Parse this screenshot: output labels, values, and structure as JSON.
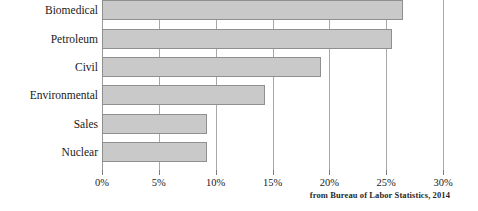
{
  "chart_data": {
    "type": "bar",
    "orientation": "horizontal",
    "title": "",
    "xlabel": "",
    "ylabel": "",
    "categories": [
      "Biomedical",
      "Petroleum",
      "Civil",
      "Environmental",
      "Sales",
      "Nuclear"
    ],
    "values": [
      26.5,
      25.5,
      19.3,
      14.3,
      9.2,
      9.2
    ],
    "xlim": [
      0,
      30
    ],
    "xtick_values": [
      0,
      5,
      10,
      15,
      20,
      25,
      30
    ],
    "xtick_labels": [
      "0%",
      "5%",
      "10%",
      "15%",
      "20%",
      "25%",
      "30%"
    ],
    "grid": true,
    "grid_axis": "x",
    "legend": null,
    "annotations": [
      "from Bureau of Labor Statistics, 2014"
    ],
    "bar_fill_color": "#c9c9c9",
    "bar_border_color": "#8f8f8f",
    "gridline_color": "#a8a8a8"
  },
  "attribution": {
    "text": "from Bureau of Labor Statistics, 2014"
  }
}
